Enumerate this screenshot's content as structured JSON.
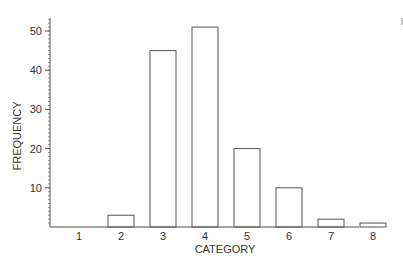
{
  "chart_data": {
    "type": "bar",
    "title": "",
    "xlabel": "CATEGORY",
    "ylabel": "FREQUENCY",
    "categories": [
      "1",
      "2",
      "3",
      "4",
      "5",
      "6",
      "7",
      "8"
    ],
    "values": [
      0,
      3,
      45,
      51,
      20,
      10,
      2,
      1
    ],
    "ylim": [
      0,
      53
    ],
    "yticks": [
      10,
      20,
      30,
      40,
      50
    ],
    "minor_tick_step": 1,
    "grid": false,
    "legend": null,
    "bar_fill": "#ffffff",
    "bar_stroke": "#555555"
  }
}
